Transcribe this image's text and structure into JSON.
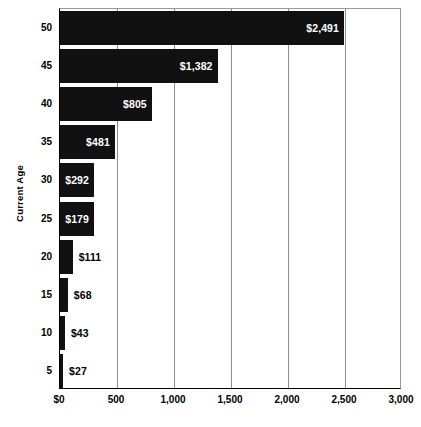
{
  "chart_data": {
    "type": "bar",
    "orientation": "horizontal",
    "title": "",
    "subtitle": "",
    "xlabel": "",
    "ylabel": "Current Age",
    "categories": [
      "50",
      "45",
      "40",
      "35",
      "30",
      "25",
      "20",
      "15",
      "10",
      "5"
    ],
    "values": [
      2491,
      1382,
      805,
      481,
      292,
      179,
      111,
      68,
      43,
      27
    ],
    "data_labels": [
      "$2,491",
      "$1,382",
      "$805",
      "$481",
      "$292",
      "$179",
      "$111",
      "$68",
      "$43",
      "$27"
    ],
    "label_placement": [
      "inside",
      "inside",
      "inside",
      "inside",
      "inside",
      "inside",
      "outside",
      "outside",
      "outside",
      "outside"
    ],
    "xlim": [
      0,
      3000
    ],
    "xticks": [
      0,
      500,
      1000,
      1500,
      2000,
      2500,
      3000
    ],
    "xtick_labels": [
      "$0",
      "500",
      "1,000",
      "1,500",
      "2,000",
      "2,500",
      "3,000"
    ],
    "grid": true,
    "grid_axis": "x",
    "legend": false,
    "bar_color": "#111111",
    "inside_label_color": "#FFFFFF",
    "outside_label_color": "#000000",
    "gridline_color": "#8E8E8E",
    "axis_color": "#000000",
    "background_color": "#FFFFFF"
  },
  "axis": {
    "y_title": "Current Age"
  }
}
